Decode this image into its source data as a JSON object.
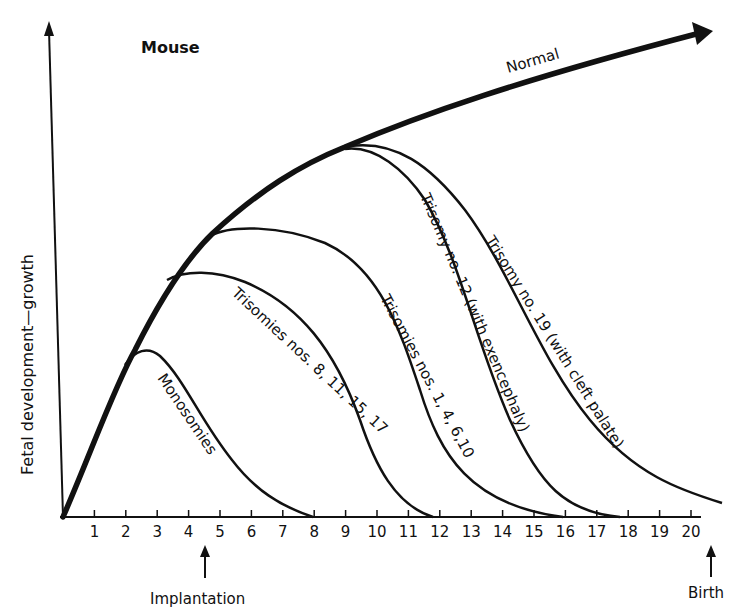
{
  "chart_data": {
    "type": "line",
    "title": "Mouse",
    "xlabel": "",
    "ylabel": "Fetal development—growth",
    "x_ticks": [
      "1",
      "2",
      "3",
      "4",
      "5",
      "6",
      "7",
      "8",
      "9",
      "10",
      "11",
      "12",
      "13",
      "14",
      "15",
      "16",
      "17",
      "18",
      "19",
      "20"
    ],
    "xlim": [
      0,
      21
    ],
    "grid": false,
    "legend": "none (curves labeled inline)",
    "annotations": [
      {
        "text": "Implantation",
        "x": 4.5,
        "arrow": "up"
      },
      {
        "text": "Birth",
        "x": 20.5,
        "arrow": "up"
      }
    ],
    "series": [
      {
        "name": "Normal",
        "style": "thick arrow",
        "x": [
          0,
          1,
          2,
          3,
          4,
          5,
          6,
          7,
          8,
          9,
          10,
          12,
          14,
          16,
          18,
          20.5
        ],
        "y": [
          0,
          28,
          52,
          70,
          82,
          91,
          98,
          104,
          109,
          113,
          117,
          124,
          130,
          136,
          142,
          149
        ]
      },
      {
        "name": "Monosomies",
        "branch_day": 2,
        "peak_day": 2.8,
        "end_day": 8.3,
        "x": [
          2,
          2.8,
          4,
          5,
          6,
          7,
          8.3
        ],
        "y": [
          52,
          56,
          46,
          28,
          14,
          5,
          0
        ]
      },
      {
        "name": "Trisomies nos. 8, 11, 15, 17",
        "branch_day": 3.5,
        "peak_day": 4.6,
        "end_day": 11.8,
        "x": [
          3.5,
          4.6,
          6,
          7,
          8,
          9,
          10,
          11,
          11.8
        ],
        "y": [
          77,
          81,
          76,
          68,
          57,
          43,
          26,
          9,
          0
        ]
      },
      {
        "name": "Trisomies nos. 1, 4, 6, 10",
        "branch_day": 4.8,
        "peak_day": 5.8,
        "end_day": 15.8,
        "x": [
          4.8,
          5.8,
          7,
          8,
          9,
          10,
          11,
          12,
          13,
          14,
          15,
          15.8
        ],
        "y": [
          89,
          94,
          93,
          90,
          85,
          78,
          68,
          55,
          40,
          24,
          9,
          0
        ]
      },
      {
        "name": "Trisomy no. 12 (with exencephaly)",
        "branch_day": 9,
        "end_day": 17.6,
        "x": [
          9,
          10,
          11,
          12,
          13,
          14,
          15,
          16,
          17,
          17.6
        ],
        "y": [
          113,
          112,
          106,
          95,
          80,
          62,
          42,
          22,
          6,
          0
        ]
      },
      {
        "name": "Trisomy no. 19 (with cleft palate)",
        "branch_day": 9,
        "end_day": 20.7,
        "x": [
          9,
          10,
          11,
          12,
          13,
          14,
          15,
          16,
          17,
          18,
          19,
          20,
          20.7
        ],
        "y": [
          113,
          113,
          109,
          101,
          89,
          74,
          58,
          43,
          30,
          19,
          10,
          4,
          3
        ]
      }
    ]
  },
  "labels": {
    "title": "Mouse",
    "ylabel": "Fetal development—growth",
    "normal": "Normal",
    "monosomies": "Monosomies",
    "tri_8": "Trisomies nos. 8, 11, 15, 17",
    "tri_1": "Trisomies nos. 1, 4, 6,10",
    "tri_12": "Trisomy no. 12 (with exencephaly)",
    "tri_19": "Trisomy no. 19 (with cleft palate)",
    "implantation": "Implantation",
    "birth": "Birth",
    "ticks": [
      "1",
      "2",
      "3",
      "4",
      "5",
      "6",
      "7",
      "8",
      "9",
      "10",
      "11",
      "12",
      "13",
      "14",
      "15",
      "16",
      "17",
      "18",
      "19",
      "20"
    ]
  }
}
